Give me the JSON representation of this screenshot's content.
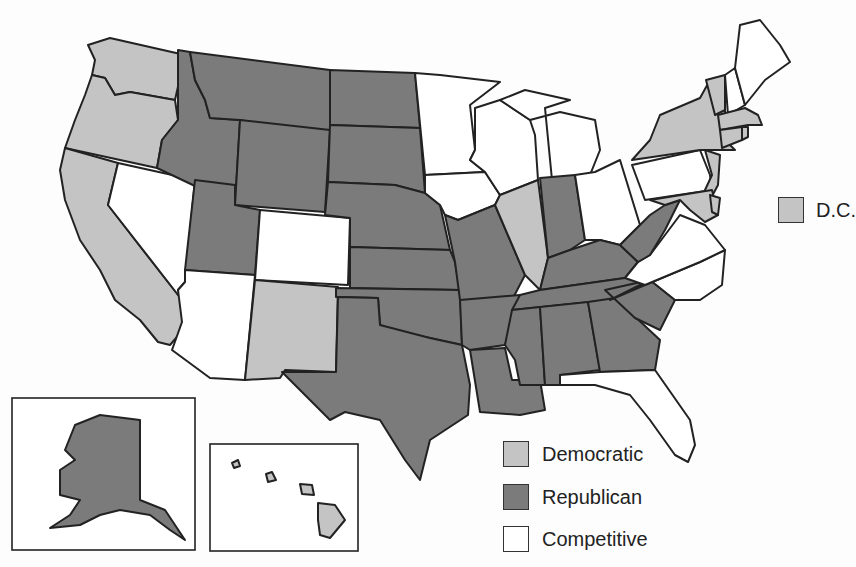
{
  "colors": {
    "democratic": "#c4c4c4",
    "republican": "#7b7b7b",
    "competitive": "#ffffff",
    "border": "#222222"
  },
  "legend": {
    "items": [
      {
        "key": "democratic",
        "label": "Democratic"
      },
      {
        "key": "republican",
        "label": "Republican"
      },
      {
        "key": "competitive",
        "label": "Competitive"
      }
    ],
    "dc": {
      "key": "democratic",
      "label": "D.C."
    }
  },
  "states": {
    "democratic": [
      "WA",
      "OR",
      "CA",
      "NM",
      "IL",
      "NY",
      "VT",
      "MA",
      "CT",
      "RI",
      "NJ",
      "DE",
      "MD",
      "HI",
      "DC"
    ],
    "republican": [
      "ID",
      "MT",
      "WY",
      "UT",
      "ND",
      "SD",
      "NE",
      "KS",
      "OK",
      "TX",
      "MO",
      "AR",
      "LA",
      "MS",
      "AL",
      "GA",
      "SC",
      "TN",
      "KY",
      "IN",
      "WV",
      "AK"
    ],
    "competitive": [
      "NV",
      "AZ",
      "CO",
      "MN",
      "WI",
      "IA",
      "MI",
      "OH",
      "PA",
      "VA",
      "NC",
      "FL",
      "NH",
      "ME"
    ]
  }
}
